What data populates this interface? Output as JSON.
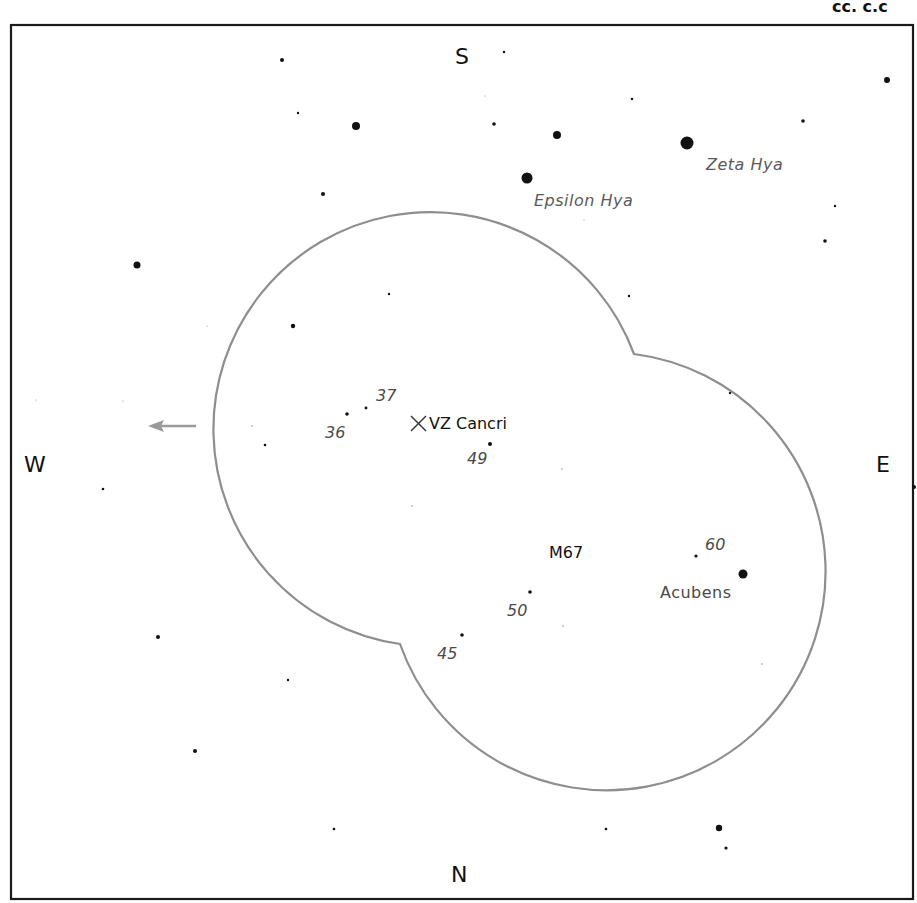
{
  "chart": {
    "corner_text": "cc. c.c",
    "cardinals": {
      "north": "N",
      "south": "S",
      "east": "E",
      "west": "W"
    },
    "frame": {
      "x": 11,
      "y": 25,
      "width": 902,
      "height": 874
    },
    "field_of_view": {
      "circle1": {
        "cx": 413,
        "cy": 425,
        "r": 217
      },
      "circle2": {
        "cx": 618,
        "cy": 572,
        "r": 219
      },
      "stroke": "#8e8e8e"
    },
    "direction_arrow": {
      "from": [
        196,
        426
      ],
      "to": [
        150,
        426
      ],
      "color": "#9a9a9a"
    },
    "target": {
      "name": "VZ Cancri",
      "x": 418,
      "y": 423
    },
    "cluster": {
      "name": "M67",
      "x": 572,
      "y": 556
    },
    "named_stars": [
      {
        "name": "Zeta Hya",
        "x": 687,
        "y": 143,
        "r": 6
      },
      {
        "name": "Epsilon Hya",
        "x": 527,
        "y": 178,
        "r": 5.5
      },
      {
        "name": "Acubens",
        "x": 743,
        "y": 574,
        "r": 4.5
      }
    ],
    "magnitude_labels": [
      {
        "label": "37",
        "x": 388,
        "y": 399
      },
      {
        "label": "36",
        "x": 337,
        "y": 436
      },
      {
        "label": "49",
        "x": 479,
        "y": 462
      },
      {
        "label": "60",
        "x": 718,
        "y": 549
      },
      {
        "label": "50",
        "x": 519,
        "y": 614
      },
      {
        "label": "45",
        "x": 449,
        "y": 657
      }
    ]
  },
  "chart_data": {
    "type": "scatter",
    "xlabel": "",
    "ylabel": "",
    "orientation": {
      "top": "S",
      "bottom": "N",
      "left": "W",
      "right": "E"
    },
    "annotations": [
      "VZ Cancri",
      "M67",
      "Zeta Hya",
      "Epsilon Hya",
      "Acubens",
      "37",
      "36",
      "49",
      "60",
      "50",
      "45"
    ],
    "stars": [
      {
        "x": 282,
        "y": 60,
        "r": 2
      },
      {
        "x": 504,
        "y": 52,
        "r": 1.2
      },
      {
        "x": 887,
        "y": 80,
        "r": 3
      },
      {
        "x": 632,
        "y": 99,
        "r": 1.2
      },
      {
        "x": 298,
        "y": 113,
        "r": 1.2
      },
      {
        "x": 494,
        "y": 124,
        "r": 1.8
      },
      {
        "x": 803,
        "y": 121,
        "r": 1.8
      },
      {
        "x": 356,
        "y": 126,
        "r": 4
      },
      {
        "x": 557,
        "y": 135,
        "r": 4
      },
      {
        "x": 687,
        "y": 143,
        "r": 6.5
      },
      {
        "x": 527,
        "y": 178,
        "r": 5.5
      },
      {
        "x": 323,
        "y": 194,
        "r": 2
      },
      {
        "x": 835,
        "y": 206,
        "r": 1.2
      },
      {
        "x": 825,
        "y": 241,
        "r": 1.8
      },
      {
        "x": 137,
        "y": 265,
        "r": 3.5
      },
      {
        "x": 389,
        "y": 294,
        "r": 1.2
      },
      {
        "x": 629,
        "y": 296,
        "r": 1.2
      },
      {
        "x": 293,
        "y": 326,
        "r": 2.2
      },
      {
        "x": 730,
        "y": 393,
        "r": 1.2
      },
      {
        "x": 366,
        "y": 408,
        "r": 1.4
      },
      {
        "x": 347,
        "y": 414,
        "r": 1.8
      },
      {
        "x": 252,
        "y": 426,
        "r": 0.8
      },
      {
        "x": 265,
        "y": 445,
        "r": 1.3
      },
      {
        "x": 490,
        "y": 444,
        "r": 2
      },
      {
        "x": 562,
        "y": 469,
        "r": 0.8
      },
      {
        "x": 103,
        "y": 489,
        "r": 1.3
      },
      {
        "x": 412,
        "y": 506,
        "r": 0.8
      },
      {
        "x": 914,
        "y": 487,
        "r": 2
      },
      {
        "x": 696,
        "y": 556,
        "r": 1.6
      },
      {
        "x": 743,
        "y": 574,
        "r": 4.5
      },
      {
        "x": 530,
        "y": 592,
        "r": 1.8
      },
      {
        "x": 563,
        "y": 626,
        "r": 0.8
      },
      {
        "x": 462,
        "y": 635,
        "r": 1.8
      },
      {
        "x": 158,
        "y": 637,
        "r": 2
      },
      {
        "x": 762,
        "y": 664,
        "r": 0.8
      },
      {
        "x": 288,
        "y": 680,
        "r": 1.2
      },
      {
        "x": 195,
        "y": 751,
        "r": 2
      },
      {
        "x": 719,
        "y": 828,
        "r": 3.2
      },
      {
        "x": 334,
        "y": 829,
        "r": 1.3
      },
      {
        "x": 606,
        "y": 829,
        "r": 1.3
      },
      {
        "x": 726,
        "y": 848,
        "r": 1.6
      },
      {
        "x": 36,
        "y": 400,
        "r": 0.6
      },
      {
        "x": 123,
        "y": 401,
        "r": 0.6
      },
      {
        "x": 207,
        "y": 326,
        "r": 0.6
      },
      {
        "x": 485,
        "y": 96,
        "r": 0.6
      },
      {
        "x": 584,
        "y": 220,
        "r": 0.6
      }
    ]
  }
}
